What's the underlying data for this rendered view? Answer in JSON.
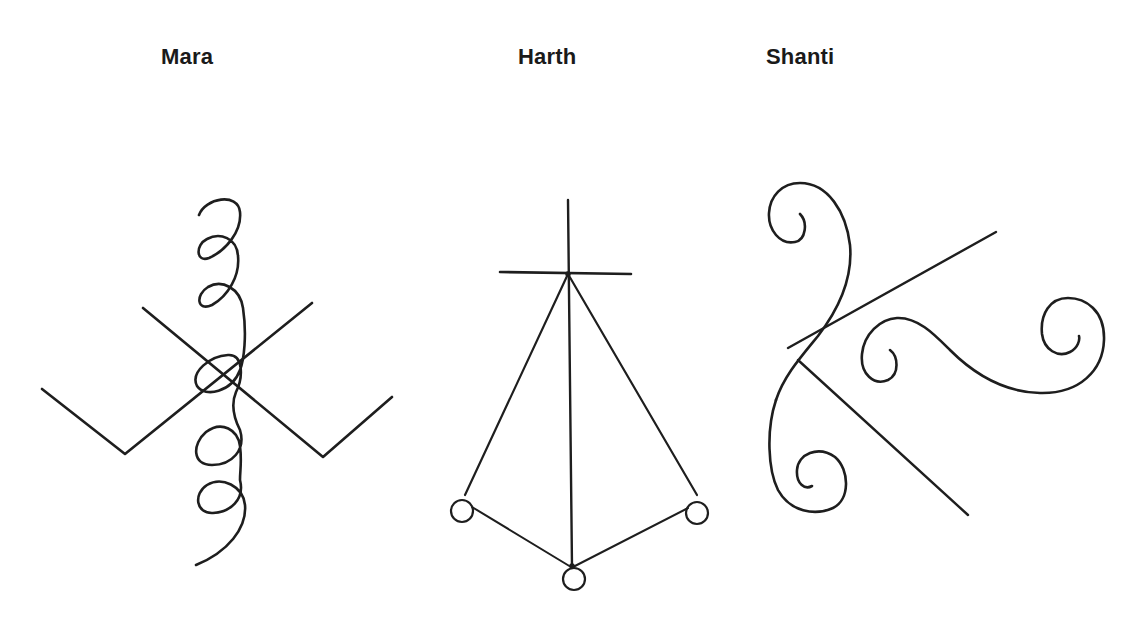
{
  "figure": {
    "background": "#ffffff",
    "stroke_color": "#1e1e1e",
    "symbols": [
      {
        "id": "mara",
        "label": "Mara",
        "elements": [
          "vertical-spiral-coil",
          "left-l-shaped-line",
          "right-l-shaped-line",
          "crossing-diagonals"
        ]
      },
      {
        "id": "harth",
        "label": "Harth",
        "elements": [
          "vertical-line",
          "horizontal-crossbar",
          "left-leg",
          "right-leg",
          "left-circle",
          "right-circle",
          "bottom-circle"
        ]
      },
      {
        "id": "shanti",
        "label": "Shanti",
        "elements": [
          "upper-left-spiral",
          "lower-left-spiral",
          "upper-diagonal-line",
          "lower-diagonal-line",
          "right-s-curve-spiral"
        ]
      }
    ]
  }
}
